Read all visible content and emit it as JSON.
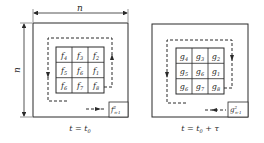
{
  "left_panel": {
    "dimension_top": "n",
    "dimension_left": "n",
    "cells": [
      "f4",
      "f3",
      "f2",
      "f5",
      "f6",
      "f1",
      "f6",
      "f7",
      "f8"
    ],
    "cell_bases": [
      "f",
      "f",
      "f",
      "f",
      "f",
      "f",
      "f",
      "f",
      "f"
    ],
    "cell_subs": [
      "4",
      "3",
      "2",
      "5",
      "6",
      "1",
      "6",
      "7",
      "8"
    ],
    "corner_base": "f",
    "corner_sup": "2",
    "corner_sub": "n-1",
    "caption_main": "t = t",
    "caption_sub": "0"
  },
  "right_panel": {
    "cells": [
      "g4",
      "g3",
      "g2",
      "g5",
      "g6",
      "g1",
      "g6",
      "g7",
      "g8"
    ],
    "cell_bases": [
      "g",
      "g",
      "g",
      "g",
      "g",
      "g",
      "g",
      "g",
      "g"
    ],
    "cell_subs": [
      "4",
      "3",
      "2",
      "5",
      "6",
      "1",
      "6",
      "7",
      "8"
    ],
    "corner_base": "g",
    "corner_sup": "2",
    "corner_sub": "n-1",
    "caption_main": "t = t",
    "caption_sub": "0",
    "caption_tail": " + τ"
  },
  "colors": {
    "line": "#2a2a2a",
    "background": "#ffffff"
  }
}
